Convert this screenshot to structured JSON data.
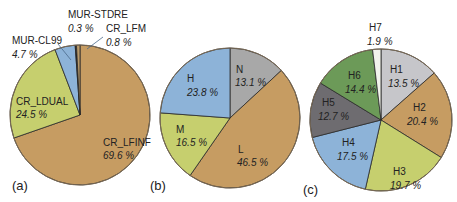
{
  "figure": {
    "panel_labels": [
      "(a)",
      "(b)",
      "(c)"
    ]
  },
  "chart_data": [
    {
      "type": "pie",
      "panel": "(a)",
      "title": "",
      "start_angle_deg": 0,
      "direction": "clockwise",
      "categories": [
        "CR_LFINF",
        "CR_LDUAL",
        "MUR-CL99",
        "MUR-STDRE",
        "CR_LFM"
      ],
      "values": [
        69.6,
        24.5,
        4.7,
        0.3,
        0.8
      ],
      "value_labels": [
        "69.6 %",
        "24.5 %",
        "4.7 %",
        "0.3 %",
        "0.8 %"
      ],
      "colors": [
        "#C69C62",
        "#C6CF6E",
        "#8DB3D8",
        "#1E1E1E",
        "#B99A6A"
      ],
      "center": [
        80,
        115
      ],
      "radius": 70,
      "labels_pos": [
        {
          "name": [
            103,
            146
          ],
          "pct": [
            103,
            159
          ],
          "inside": true
        },
        {
          "name": [
            16,
            105
          ],
          "pct": [
            16,
            118
          ],
          "inside": true
        },
        {
          "name": [
            12,
            44
          ],
          "pct": [
            12,
            58
          ],
          "inside": false,
          "leader": [
            [
              58,
              44
            ],
            [
              71,
              60
            ]
          ]
        },
        {
          "name": [
            68,
            18
          ],
          "pct": [
            68,
            32
          ],
          "inside": false
        },
        {
          "name": [
            106,
            32
          ],
          "pct": [
            106,
            46
          ],
          "inside": false,
          "leader": [
            [
              103,
              37
            ],
            [
              87,
              49
            ]
          ]
        }
      ]
    },
    {
      "type": "pie",
      "panel": "(b)",
      "title": "",
      "start_angle_deg": 0,
      "direction": "clockwise",
      "categories": [
        "N",
        "L",
        "M",
        "H"
      ],
      "values": [
        13.1,
        46.5,
        16.5,
        23.8
      ],
      "value_labels": [
        "13.1 %",
        "46.5 %",
        "16.5 %",
        "23.8 %"
      ],
      "colors": [
        "#A8A8A8",
        "#C69C62",
        "#C6CF6E",
        "#8DB3D8"
      ],
      "center": [
        230,
        118
      ],
      "radius": 70,
      "labels_pos": [
        {
          "name": [
            236,
            73
          ],
          "pct": [
            235,
            86
          ],
          "inside": true
        },
        {
          "name": [
            238,
            153
          ],
          "pct": [
            237,
            166
          ],
          "inside": true
        },
        {
          "name": [
            176,
            133
          ],
          "pct": [
            176,
            146
          ],
          "inside": true
        },
        {
          "name": [
            187,
            82
          ],
          "pct": [
            187,
            96
          ],
          "inside": true
        }
      ]
    },
    {
      "type": "pie",
      "panel": "(c)",
      "title": "",
      "start_angle_deg": 0,
      "direction": "clockwise",
      "categories": [
        "H1",
        "H2",
        "H3",
        "H4",
        "H5",
        "H6",
        "H7"
      ],
      "values": [
        13.5,
        20.4,
        19.7,
        17.5,
        12.7,
        14.4,
        1.9
      ],
      "value_labels": [
        "13.5 %",
        "20.4 %",
        "19.7 %",
        "17.5 %",
        "12.7 %",
        "14.4 %",
        "1.9 %"
      ],
      "colors": [
        "#C6C6CA",
        "#C69C62",
        "#C6CF6E",
        "#8DB3D8",
        "#6E6C70",
        "#6C9A58",
        "#F2F3EC"
      ],
      "center": [
        381,
        120
      ],
      "radius": 71,
      "labels_pos": [
        {
          "name": [
            390,
            73
          ],
          "pct": [
            388,
            87
          ],
          "inside": true
        },
        {
          "name": [
            413,
            111
          ],
          "pct": [
            407,
            125
          ],
          "inside": true
        },
        {
          "name": [
            393,
            175
          ],
          "pct": [
            390,
            189
          ],
          "inside": true
        },
        {
          "name": [
            342,
            146
          ],
          "pct": [
            337,
            160
          ],
          "inside": true
        },
        {
          "name": [
            322,
            106
          ],
          "pct": [
            318,
            120
          ],
          "inside": true
        },
        {
          "name": [
            348,
            79
          ],
          "pct": [
            345,
            93
          ],
          "inside": true
        },
        {
          "name": [
            369,
            31
          ],
          "pct": [
            367,
            45
          ],
          "inside": false
        }
      ]
    }
  ]
}
